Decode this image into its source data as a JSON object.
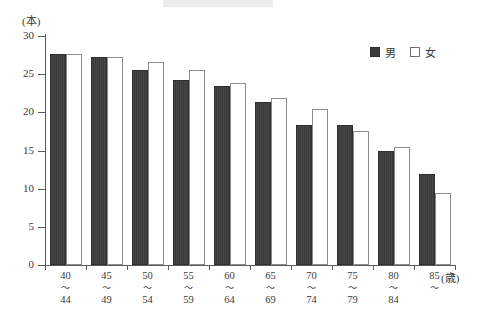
{
  "chart_data": {
    "type": "bar",
    "title": "",
    "xlabel": "(歳)",
    "ylabel": "(本)",
    "ylim": [
      0,
      30
    ],
    "ytick_step": 5,
    "yticks": [
      0,
      5,
      10,
      15,
      20,
      25,
      30
    ],
    "grid": false,
    "legend_position": "top-right",
    "categories": [
      "40\n～\n44",
      "45\n～\n49",
      "50\n～\n54",
      "55\n～\n59",
      "60\n～\n64",
      "65\n～\n69",
      "70\n～\n74",
      "75\n～\n79",
      "80\n～\n84",
      "85\n～"
    ],
    "category_parts": [
      {
        "from": "40",
        "tilde": "～",
        "to": "44"
      },
      {
        "from": "45",
        "tilde": "～",
        "to": "49"
      },
      {
        "from": "50",
        "tilde": "～",
        "to": "54"
      },
      {
        "from": "55",
        "tilde": "～",
        "to": "59"
      },
      {
        "from": "60",
        "tilde": "～",
        "to": "64"
      },
      {
        "from": "65",
        "tilde": "～",
        "to": "69"
      },
      {
        "from": "70",
        "tilde": "～",
        "to": "74"
      },
      {
        "from": "75",
        "tilde": "～",
        "to": "79"
      },
      {
        "from": "80",
        "tilde": "～",
        "to": "84"
      },
      {
        "from": "85",
        "tilde": "～",
        "to": ""
      }
    ],
    "series": [
      {
        "name": "男",
        "color": "#3b3b3b",
        "values": [
          27.7,
          27.3,
          25.5,
          24.2,
          23.4,
          21.4,
          18.4,
          18.3,
          15.0,
          11.9
        ]
      },
      {
        "name": "女",
        "color": "#ffffff",
        "values": [
          27.7,
          27.3,
          26.6,
          25.6,
          23.9,
          21.9,
          20.5,
          17.5,
          15.4,
          9.4
        ]
      }
    ]
  },
  "legend": {
    "items": [
      {
        "label": "男",
        "style": "filled"
      },
      {
        "label": "女",
        "style": "outline"
      }
    ]
  },
  "axis": {
    "unit_y": "(本)",
    "unit_x": "(歳)"
  },
  "colors": {
    "male_fill": "#3b3b3b",
    "female_fill": "#ffffff",
    "axis": "#5a5a5a",
    "text": "#3a3a3a",
    "background": "#ffffff"
  }
}
